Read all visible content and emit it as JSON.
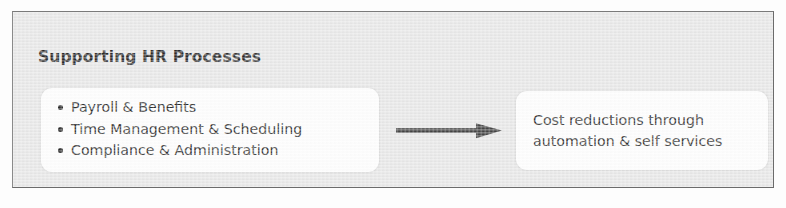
{
  "diagram": {
    "title": "Supporting HR Processes",
    "panel": {
      "background_color": "#e6e6e6",
      "border_color": "#6b6b6b"
    },
    "process_box": {
      "name": "supporting-hr-processes-list",
      "background_color": "#fefefe",
      "items": [
        "Payroll & Benefits",
        "Time Management & Scheduling",
        "Compliance & Administration"
      ]
    },
    "connector": {
      "icon": "arrow-right-icon",
      "direction": "right",
      "color": "#3a3a3a"
    },
    "outcome_box": {
      "name": "outcome-box",
      "background_color": "#fefefe",
      "lines": [
        "Cost reductions through",
        "automation & self services"
      ]
    }
  }
}
